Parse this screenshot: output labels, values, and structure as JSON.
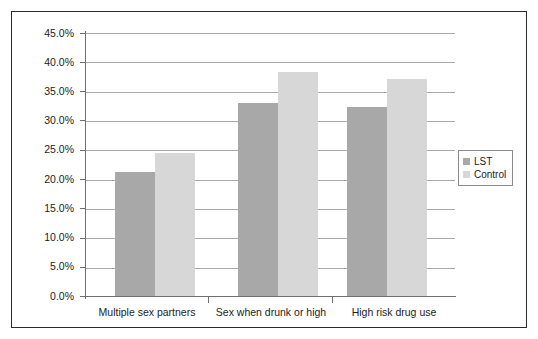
{
  "chart_data": {
    "type": "bar",
    "title": "",
    "subtitle": "",
    "xlabel": "",
    "ylabel": "",
    "categories": [
      "Multiple sex partners",
      "Sex when drunk or high",
      "High risk drug use"
    ],
    "series": [
      {
        "name": "LST",
        "color": "#a8a8a8",
        "values": [
          21.3,
          33.0,
          32.4
        ]
      },
      {
        "name": "Control",
        "color": "#d7d7d7",
        "values": [
          24.5,
          38.4,
          37.2
        ]
      }
    ],
    "ylim": [
      0,
      45
    ],
    "ytick_values": [
      0,
      5,
      10,
      15,
      20,
      25,
      30,
      35,
      40,
      45
    ],
    "ytick_labels": [
      "0.0%",
      "5.0%",
      "10.0%",
      "15.0%",
      "20.0%",
      "25.0%",
      "30.0%",
      "35.0%",
      "40.0%",
      "45.0%"
    ],
    "grid": true,
    "grid_color": "#a9a9a9",
    "legend_position": "right",
    "annotations": []
  },
  "legend": {
    "entries": [
      {
        "label": "LST"
      },
      {
        "label": "Control"
      }
    ]
  }
}
